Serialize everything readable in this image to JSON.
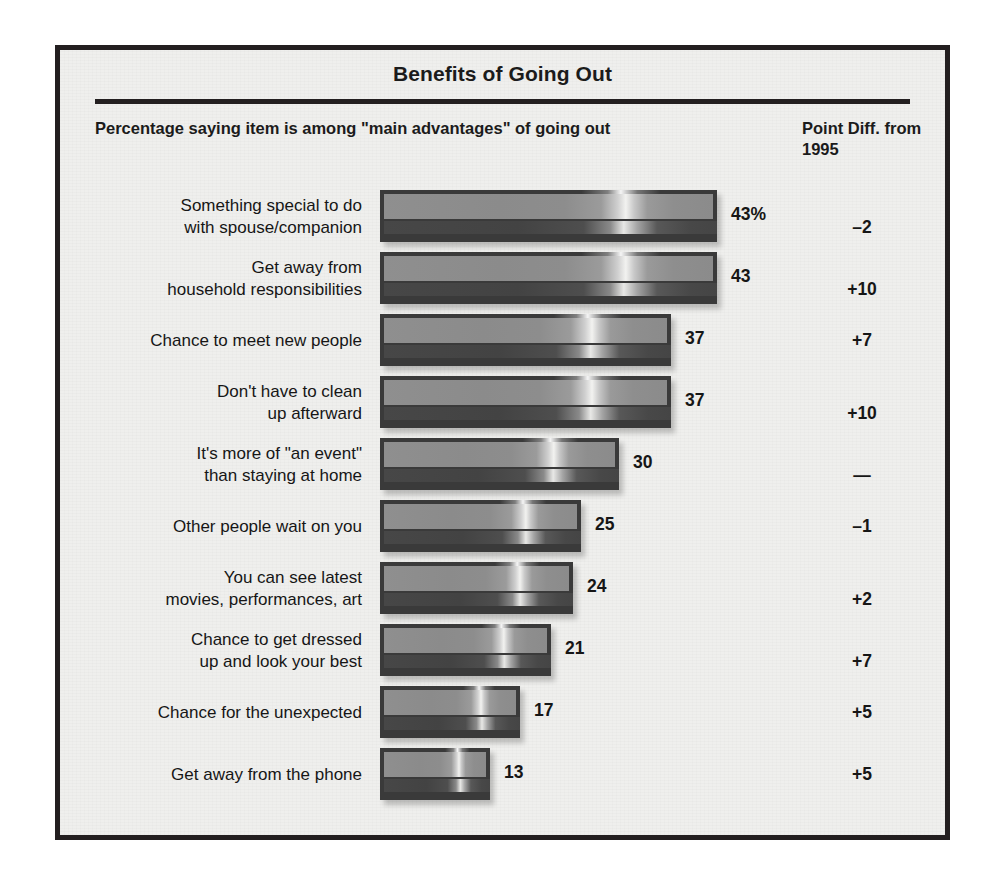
{
  "title": "Benefits of Going Out",
  "columns": {
    "left_header": "Percentage saying item is among \"main advantages\"\nof going out",
    "right_header": "Point Diff.\nfrom 1995"
  },
  "chart_data": {
    "type": "bar",
    "title": "Benefits of Going Out",
    "subtitle": "Percentage saying item is among \"main advantages\" of going out",
    "orientation": "horizontal",
    "xlabel": "",
    "ylabel": "",
    "xlim": [
      0,
      50
    ],
    "grid": false,
    "legend": "none",
    "value_suffix_first": "%",
    "extra_column_label": "Point Diff. from 1995",
    "categories": [
      "Something special to do\nwith spouse/companion",
      "Get away from\nhousehold responsibilities",
      "Chance to meet new people",
      "Don't have to clean\nup afterward",
      "It's more of \"an event\"\nthan staying at home",
      "Other people wait on you",
      "You can see latest\nmovies, performances, art",
      "Chance to get dressed\nup and look your best",
      "Chance for the unexpected",
      "Get away from the phone"
    ],
    "values": [
      43,
      43,
      37,
      37,
      30,
      25,
      24,
      21,
      17,
      13
    ],
    "value_labels": [
      "43%",
      "43",
      "37",
      "37",
      "30",
      "25",
      "24",
      "21",
      "17",
      "13"
    ],
    "point_diff": [
      "–2",
      "+10",
      "+7",
      "+10",
      "—",
      "–1",
      "+2",
      "+7",
      "+5",
      "+5"
    ]
  },
  "colors": {
    "frame": "#231f20",
    "panel_background": "#efefed",
    "bar_face": "#8d8d8d",
    "bar_dark": "#454545",
    "text": "#161616"
  }
}
